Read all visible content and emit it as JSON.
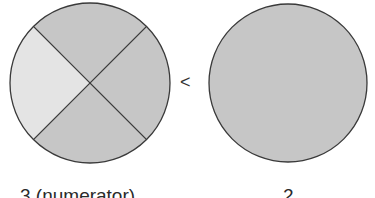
{
  "diagram": {
    "left_circle": {
      "parts": 4,
      "shaded_parts": 3,
      "unshaded_parts": 1,
      "label": "3 (numerator)"
    },
    "comparison_symbol": "<",
    "right_circle": {
      "parts": 1,
      "shaded_parts": 1,
      "label": "2"
    },
    "colors": {
      "shaded": "#c6c6c6",
      "unshaded": "#e4e4e4",
      "outline": "#3a3a3a"
    }
  }
}
